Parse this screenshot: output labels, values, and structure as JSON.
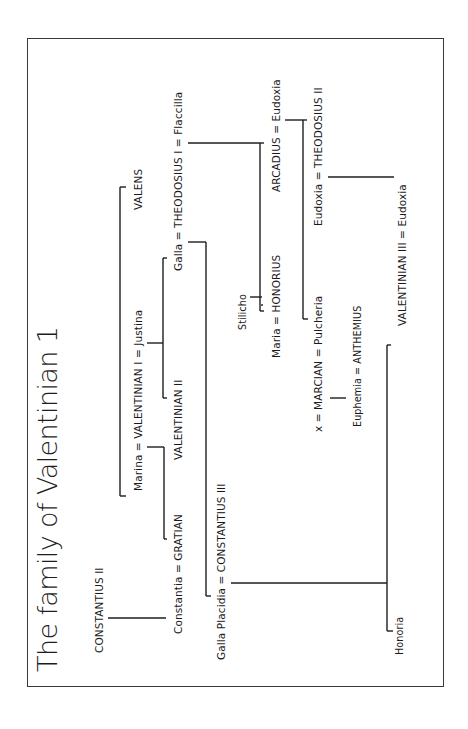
{
  "title": "The family of Valentinian 1",
  "nodes": {
    "constantius_ii": "CONSTANTIUS II",
    "constantia_gratian": "Constantia = GRATIAN",
    "marina_valentinian_i_justina": "Marina = VALENTINIAN I = Justina",
    "valens": "VALENS",
    "valentinian_ii": "VALENTINIAN II",
    "galla_theodosius_i_flaccilla": "Galla = THEODOSIUS I = Flaccilla",
    "galla_placidia_constantius_iii": "Galla Placidia = CONSTANTIUS III",
    "stilicho": "Stilicho",
    "maria_honorius": "Maria = HONORIUS",
    "arcadius_eudoxia": "ARCADIUS = Eudoxia",
    "x_marcian_pulcheria": "x = MARCIAN = Pulcheria",
    "euphemia_anthemius": "Euphemia = ANTHEMIUS",
    "eudoxia_theodosius_ii": "Eudoxia = THEODOSIUS II",
    "valentinian_iii_eudoxia": "VALENTINIAN III = Eudoxia",
    "honoria": "Honoria"
  },
  "relations": [
    {
      "parents": "CONSTANTIUS II",
      "child": "Constantia"
    },
    {
      "parents": "Marina = VALENTINIAN I",
      "child": "GRATIAN"
    },
    {
      "parents": "VALENTINIAN I = Justina",
      "children": [
        "VALENTINIAN II",
        "Galla"
      ]
    },
    {
      "sibling_of": "VALENTINIAN I",
      "name": "VALENS"
    },
    {
      "parents": "Galla = THEODOSIUS I",
      "child": "Galla Placidia"
    },
    {
      "parents": "THEODOSIUS I = Flaccilla",
      "children": [
        "HONORIUS",
        "ARCADIUS"
      ]
    },
    {
      "parents": "Stilicho",
      "child": "Maria"
    },
    {
      "parents": "ARCADIUS = Eudoxia",
      "children": [
        "Pulcheria",
        "THEODOSIUS II"
      ]
    },
    {
      "parents": "x = MARCIAN",
      "child": "Euphemia"
    },
    {
      "parents": "Galla Placidia = CONSTANTIUS III",
      "children": [
        "Honoria",
        "VALENTINIAN III"
      ]
    },
    {
      "parents": "Eudoxia = THEODOSIUS II",
      "child": "Eudoxia (wife of VALENTINIAN III)"
    }
  ],
  "colors": {
    "line": "#1e1e1e",
    "frame": "#3a3a3a",
    "background": "#ffffff",
    "text": "#1a1a1a"
  }
}
